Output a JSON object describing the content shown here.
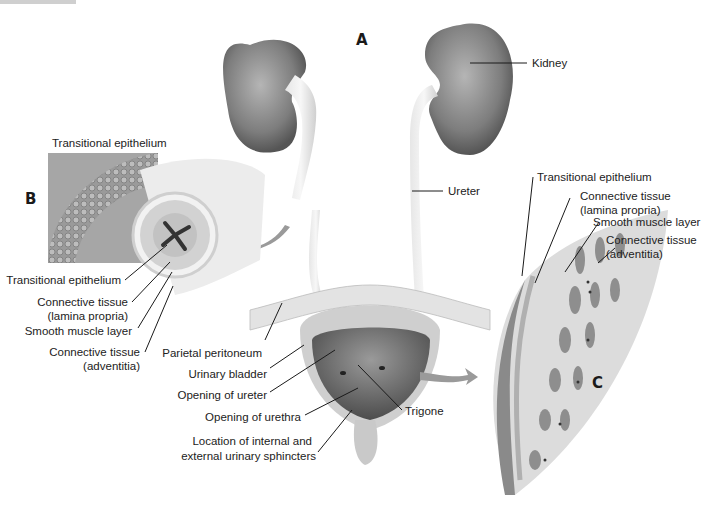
{
  "figure": {
    "panels": {
      "a": "A",
      "b": "B",
      "c": "C"
    },
    "panel_a": {
      "labels": {
        "kidney": "Kidney",
        "ureter": "Ureter",
        "parietal_peritoneum": "Parietal peritoneum",
        "urinary_bladder": "Urinary bladder",
        "opening_of_ureter": "Opening of ureter",
        "opening_of_urethra": "Opening of urethra",
        "trigone": "Trigone",
        "sphincters_line1": "Location of internal and",
        "sphincters_line2": "external urinary sphincters"
      }
    },
    "panel_b": {
      "inset_title": "Transitional epithelium",
      "labels": {
        "transitional_epithelium": "Transitional epithelium",
        "connective_lp_line1": "Connective tissue",
        "connective_lp_line2": "(lamina propria)",
        "smooth_muscle": "Smooth muscle layer",
        "connective_adv_line1": "Connective tissue",
        "connective_adv_line2": "(adventitia)"
      }
    },
    "panel_c": {
      "labels": {
        "transitional_epithelium": "Transitional epithelium",
        "connective_lp_line1": "Connective tissue",
        "connective_lp_line2": "(lamina propria)",
        "smooth_muscle": "Smooth muscle layer",
        "connective_adv_line1": "Connective tissue",
        "connective_adv_line2": "(adventitia)"
      }
    },
    "colors": {
      "tissue_gray": "#8a8a8a",
      "light_gray": "#d9d9d9",
      "arrow_gray": "#9a9a9a",
      "ink": "#1a1a1a"
    }
  }
}
